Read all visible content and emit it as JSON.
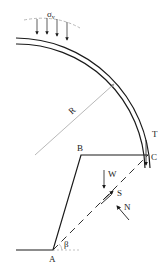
{
  "diagram": {
    "type": "mechanics-free-body-diagram",
    "labels": {
      "sigma_v": "σ",
      "sigma_v_sub": "v",
      "radius": "R",
      "point_a": "A",
      "point_b": "B",
      "point_c": "C",
      "weight": "W",
      "shear": "S",
      "normal": "N",
      "tension": "T",
      "angle": "β"
    },
    "colors": {
      "line": "#1a1a1a",
      "dimension": "#9a9a9a",
      "dashed": "#1a1a1a"
    }
  }
}
